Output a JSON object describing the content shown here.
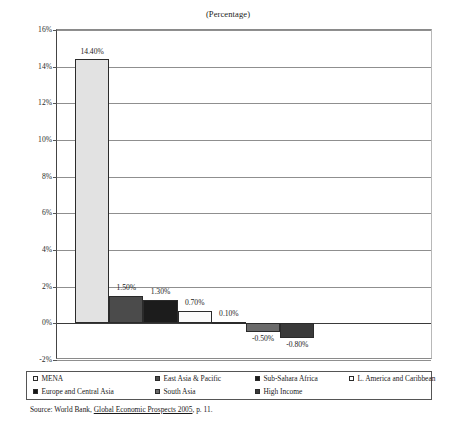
{
  "chart_data": {
    "type": "bar",
    "title": "(Percentage)",
    "xlabel": "",
    "ylabel": "",
    "ylim": [
      -2,
      16
    ],
    "ytick_step": 2,
    "ytick_labels": [
      "16%",
      "14%",
      "12%",
      "10%",
      "8%",
      "6%",
      "4%",
      "2%",
      "0%",
      "-2%"
    ],
    "ytick_values": [
      16,
      14,
      12,
      10,
      8,
      6,
      4,
      2,
      0,
      -2
    ],
    "grid": true,
    "legend_position": "bottom",
    "categories": [
      "MENA",
      "East Asia & Pacific",
      "Sub-Sahara Africa",
      "L. America and Caribbean",
      "Europe and Central Asia",
      "South Asia",
      "High Income"
    ],
    "values": [
      14.4,
      1.5,
      1.3,
      0.7,
      0.1,
      -0.5,
      -0.8
    ],
    "data_labels": [
      "14.40%",
      "1.50%",
      "1.30%",
      "0.70%",
      "0.10%",
      "-0.50%",
      "-0.80%"
    ],
    "colors": [
      "#e2e2e2",
      "#4b4b4b",
      "#1c1c1c",
      "#fafafa",
      "#141414",
      "#6a6a6a",
      "#3a3a3a"
    ]
  },
  "legend": {
    "rows": [
      [
        {
          "label": "MENA",
          "color": "#f4f4f4"
        },
        {
          "label": "East Asia & Pacific",
          "color": "#4b4b4b"
        },
        {
          "label": "Sub-Sahara Africa",
          "color": "#1c1c1c"
        },
        {
          "label": "L. America and Caribbean",
          "color": "#ffffff"
        }
      ],
      [
        {
          "label": "Europe and Central Asia",
          "color": "#141414"
        },
        {
          "label": "South Asia",
          "color": "#6a6a6a"
        },
        {
          "label": "High Income",
          "color": "#3a3a3a"
        }
      ]
    ]
  },
  "source": {
    "prefix": "Source: World Bank, ",
    "title": "Global Economic Prospects 2005",
    "suffix": ", p. 11."
  }
}
